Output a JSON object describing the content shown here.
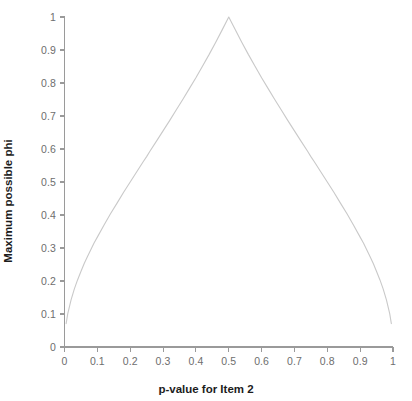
{
  "chart_data": {
    "type": "line",
    "title": "",
    "subtitle": "",
    "xlabel": "p-value for Item 2",
    "ylabel": "Maximum possible phi",
    "xlim": [
      0,
      1
    ],
    "ylim": [
      0,
      1
    ],
    "grid": false,
    "legend": null,
    "legend_position": "none",
    "annotations": [],
    "xticks": [
      "0",
      "0.1",
      "0.2",
      "0.3",
      "0.4",
      "0.5",
      "0.6",
      "0.7",
      "0.8",
      "0.9",
      "1"
    ],
    "xtick_values": [
      0,
      0.1,
      0.2,
      0.3,
      0.4,
      0.5,
      0.6,
      0.7,
      0.8,
      0.9,
      1
    ],
    "yticks": [
      "0",
      "0.1",
      "0.2",
      "0.3",
      "0.4",
      "0.5",
      "0.6",
      "0.7",
      "0.8",
      "0.9",
      "1"
    ],
    "ytick_values": [
      0,
      0.1,
      0.2,
      0.3,
      0.4,
      0.5,
      0.6,
      0.7,
      0.8,
      0.9,
      1
    ],
    "line_color": "#c9c9c9",
    "line_width": 1.1,
    "axis_color": "#9a9a9a",
    "series": [
      {
        "name": "Maximum possible phi",
        "x": [
          0.005,
          0.01,
          0.02,
          0.03,
          0.04,
          0.05,
          0.06,
          0.07,
          0.08,
          0.09,
          0.1,
          0.12,
          0.14,
          0.16,
          0.18,
          0.2,
          0.22,
          0.24,
          0.25,
          0.26,
          0.28,
          0.3,
          0.32,
          0.34,
          0.36,
          0.38,
          0.4,
          0.42,
          0.44,
          0.46,
          0.48,
          0.5,
          0.52,
          0.54,
          0.56,
          0.58,
          0.6,
          0.62,
          0.64,
          0.66,
          0.68,
          0.7,
          0.72,
          0.74,
          0.75,
          0.76,
          0.78,
          0.8,
          0.82,
          0.84,
          0.86,
          0.88,
          0.9,
          0.91,
          0.92,
          0.93,
          0.94,
          0.95,
          0.96,
          0.97,
          0.98,
          0.99,
          0.995
        ],
        "y": [
          0.071,
          0.101,
          0.143,
          0.176,
          0.204,
          0.229,
          0.253,
          0.274,
          0.295,
          0.315,
          0.333,
          0.369,
          0.404,
          0.436,
          0.469,
          0.5,
          0.531,
          0.562,
          0.577,
          0.593,
          0.624,
          0.655,
          0.686,
          0.718,
          0.75,
          0.783,
          0.816,
          0.851,
          0.886,
          0.923,
          0.961,
          1.0,
          0.961,
          0.923,
          0.886,
          0.851,
          0.816,
          0.783,
          0.75,
          0.718,
          0.686,
          0.655,
          0.624,
          0.593,
          0.577,
          0.562,
          0.531,
          0.5,
          0.469,
          0.436,
          0.404,
          0.369,
          0.333,
          0.315,
          0.295,
          0.274,
          0.253,
          0.229,
          0.204,
          0.176,
          0.143,
          0.101,
          0.071
        ]
      }
    ]
  }
}
